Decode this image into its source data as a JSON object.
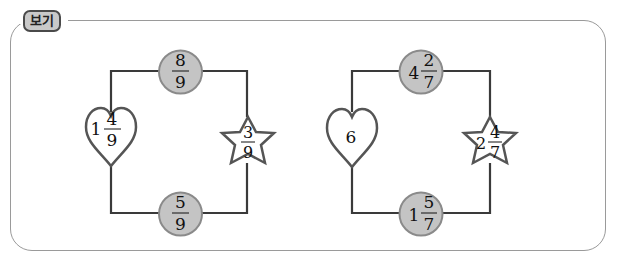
{
  "label": "보기",
  "colors": {
    "frame_border": "#9a9a9a",
    "badge_fill": "#c9c9c9",
    "circle_fill": "#c4c4c4",
    "line": "#3a3a3a"
  },
  "examples": [
    {
      "top_circle": {
        "whole": "",
        "num": "8",
        "den": "9"
      },
      "heart": {
        "whole": "1",
        "num": "4",
        "den": "9"
      },
      "star": {
        "whole": "",
        "num": "3",
        "den": "9"
      },
      "bottom_circle": {
        "whole": "",
        "num": "5",
        "den": "9"
      }
    },
    {
      "top_circle": {
        "whole": "4",
        "num": "2",
        "den": "7"
      },
      "heart": {
        "whole": "6",
        "num": "",
        "den": ""
      },
      "star": {
        "whole": "2",
        "num": "4",
        "den": "7"
      },
      "bottom_circle": {
        "whole": "1",
        "num": "5",
        "den": "7"
      }
    }
  ]
}
